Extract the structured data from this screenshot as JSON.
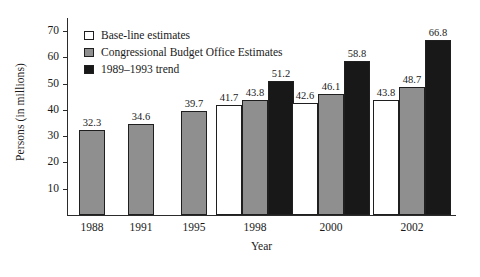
{
  "chart_data": {
    "type": "bar",
    "title": "",
    "xlabel": "Year",
    "ylabel": "Persons (in millions)",
    "categories": [
      "1988",
      "1991",
      "1995",
      "1998",
      "2000",
      "2002"
    ],
    "series": [
      {
        "name": "Base-line estimates",
        "key": "baseline",
        "color": "#ffffff",
        "values": [
          null,
          null,
          null,
          41.7,
          42.6,
          43.8
        ]
      },
      {
        "name": "Congressional Budget Office Estimates",
        "key": "cbo",
        "color": "#8f8f8f",
        "values": [
          32.3,
          34.6,
          39.7,
          43.8,
          46.1,
          48.7
        ]
      },
      {
        "name": "1989–1993 trend",
        "key": "trend",
        "color": "#181818",
        "values": [
          null,
          null,
          null,
          51.2,
          58.8,
          66.8
        ]
      }
    ],
    "ylim": [
      0,
      75
    ],
    "yticks": [
      10,
      20,
      30,
      40,
      50,
      60,
      70
    ],
    "ytick_labels": [
      "10",
      "20",
      "30",
      "40",
      "50",
      "60",
      "70"
    ],
    "grid": false,
    "legend_position": "top-left"
  },
  "legend": {
    "items": [
      {
        "label": "Base-line estimates",
        "key": "baseline"
      },
      {
        "label": "Congressional Budget Office Estimates",
        "key": "cbo"
      },
      {
        "label": "1989–1993 trend",
        "key": "trend"
      }
    ]
  }
}
